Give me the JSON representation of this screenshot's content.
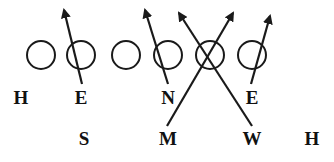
{
  "diagram": {
    "type": "football-play-diagram",
    "colors": {
      "stroke": "#1a1a1a",
      "background": "#ffffff",
      "text": "#111111"
    },
    "offensive_line": [
      {
        "id": "ol1",
        "shape": "circle",
        "cx": 41,
        "cy": 55
      },
      {
        "id": "ol2",
        "shape": "circle",
        "cx": 81,
        "cy": 55
      },
      {
        "id": "ol3",
        "shape": "circle",
        "cx": 126,
        "cy": 55
      },
      {
        "id": "ol4",
        "shape": "circle",
        "cx": 168,
        "cy": 55
      },
      {
        "id": "ol5",
        "shape": "circle",
        "cx": 210,
        "cy": 55
      },
      {
        "id": "ol6",
        "shape": "circle",
        "cx": 252,
        "cy": 55
      }
    ],
    "circle_radius": 14,
    "defenders_front": [
      {
        "label": "H",
        "x": 21,
        "y": 97
      },
      {
        "label": "E",
        "x": 81,
        "y": 97
      },
      {
        "label": "N",
        "x": 168,
        "y": 97
      },
      {
        "label": "E",
        "x": 252,
        "y": 97
      }
    ],
    "defenders_second": [
      {
        "label": "S",
        "x": 84,
        "y": 138
      },
      {
        "label": "M",
        "x": 168,
        "y": 138
      },
      {
        "label": "W",
        "x": 252,
        "y": 138
      },
      {
        "label": "H",
        "x": 312,
        "y": 138
      }
    ],
    "arrows": [
      {
        "from_label": "E",
        "x1": 82,
        "y1": 84,
        "x2": 64,
        "y2": 10
      },
      {
        "from_label": "N",
        "x1": 168,
        "y1": 84,
        "x2": 145,
        "y2": 10
      },
      {
        "from_label": "M",
        "x1": 167,
        "y1": 126,
        "x2": 233,
        "y2": 13
      },
      {
        "from_label": "W",
        "x1": 252,
        "y1": 126,
        "x2": 179,
        "y2": 13
      },
      {
        "from_label": "E",
        "x1": 251,
        "y1": 84,
        "x2": 270,
        "y2": 16
      }
    ]
  }
}
